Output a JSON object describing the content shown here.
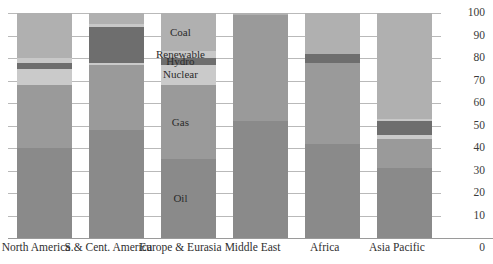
{
  "chart_data": {
    "type": "bar",
    "stacked": true,
    "title": "",
    "subtitle": "",
    "xlabel": "",
    "ylabel": "",
    "ylim": [
      0,
      100
    ],
    "yticks": [
      "100",
      "90",
      "80",
      "70",
      "60",
      "50",
      "40",
      "30",
      "20",
      "10",
      "0"
    ],
    "grid": true,
    "legend_position": "overlay-on-bars",
    "categories": [
      "North America",
      "S.& Cent. America",
      "Europe & Eurasia",
      "Middle East",
      "Africa",
      "Asia Pacific"
    ],
    "series": [
      {
        "name": "Coal",
        "color": "#b0b0b0",
        "values": [
          20,
          5,
          17,
          1,
          18,
          47
        ]
      },
      {
        "name": "Renewable",
        "color": "#c8c8c8",
        "values": [
          2,
          1,
          3,
          0,
          0,
          1
        ]
      },
      {
        "name": "Hydro",
        "color": "#6e6e6e",
        "values": [
          3,
          16,
          3,
          0,
          4,
          6
        ]
      },
      {
        "name": "Nuclear",
        "color": "#cacaca",
        "values": [
          7,
          1,
          9,
          0,
          0,
          2
        ]
      },
      {
        "name": "Gas",
        "color": "#9a9a9a",
        "values": [
          28,
          29,
          33,
          47,
          36,
          13
        ]
      },
      {
        "name": "Oil",
        "color": "#8a8a8a",
        "values": [
          40,
          48,
          35,
          52,
          42,
          31
        ]
      }
    ],
    "legend_labels": [
      "Coal",
      "Renewable",
      "Hydro",
      "Nuclear",
      "Gas",
      "Oil"
    ]
  },
  "colors": {
    "gridline": "#b9b9b9",
    "axis": "#9a9a9a",
    "text": "#2f2f2f",
    "background": "#ffffff"
  }
}
